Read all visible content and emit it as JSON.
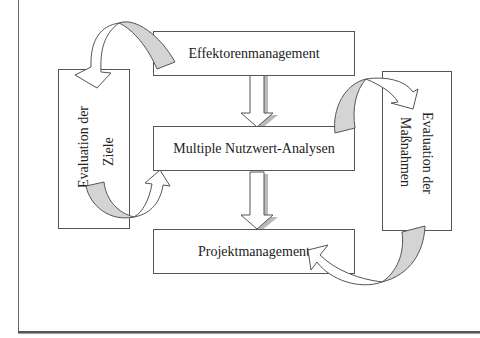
{
  "diagram": {
    "boxes": {
      "effektoren": {
        "label": "Effektorenmanagement"
      },
      "nutzwert": {
        "label": "Multiple Nutzwert-Analysen"
      },
      "projekt": {
        "label": "Projektmanagement"
      },
      "ziele": {
        "line1": "Evaluation der",
        "line2": "Ziele"
      },
      "massnahmen": {
        "line1": "Evaluation der",
        "line2": "Maßnahmen"
      }
    },
    "arrows": [
      {
        "from": "effektoren",
        "to": "nutzwert",
        "type": "block-down"
      },
      {
        "from": "nutzwert",
        "to": "projekt",
        "type": "block-down"
      },
      {
        "from": "effektoren",
        "to": "ziele",
        "type": "curved"
      },
      {
        "from": "ziele",
        "to": "nutzwert",
        "type": "curved"
      },
      {
        "from": "nutzwert",
        "to": "massnahmen",
        "type": "curved"
      },
      {
        "from": "massnahmen",
        "to": "projekt",
        "type": "curved"
      }
    ],
    "colors": {
      "stroke": "#555555",
      "arrow_shade": "#d4d4d4",
      "arrow_fill": "#ffffff"
    }
  }
}
